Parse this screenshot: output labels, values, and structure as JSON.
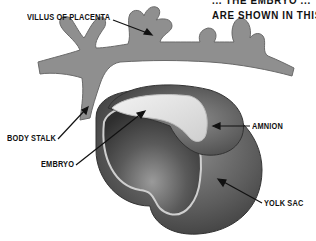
{
  "caption": {
    "line1": "... THE EMBRYO ...",
    "line2": "ARE SHOWN IN THIS"
  },
  "labels": {
    "villus": "VILLUS OF PLACENTA",
    "body_stalk": "BODY STALK",
    "embryo": "EMBRYO",
    "amnion": "AMNION",
    "yolk_sac": "YOLK SAC"
  },
  "colors": {
    "placenta": "#8f8f8f",
    "amnion": "#6e6e6e",
    "yolk_sac": "#5a5a5a",
    "embryo": "#e6e6e6",
    "background": "#ffffff",
    "text": "#111111"
  }
}
